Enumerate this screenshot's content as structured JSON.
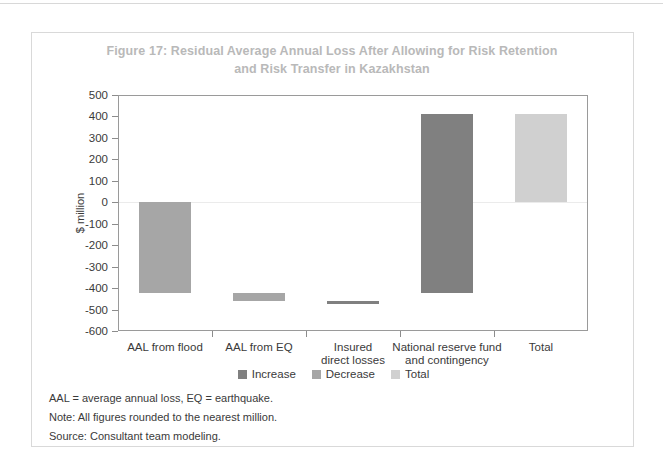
{
  "figure": {
    "title_line1": "Figure 17: Residual Average Annual Loss After Allowing for Risk Retention",
    "title_line2": "and Risk Transfer in Kazakhstan",
    "title_color": "#b9b9b9"
  },
  "notes": [
    "AAL = average annual loss, EQ = earthquake.",
    "Note: All figures rounded to the nearest million.",
    "Source: Consultant team modeling."
  ],
  "colors": {
    "increase": "#808080",
    "decrease": "#a6a6a6",
    "total": "#d0d0d0",
    "axis": "#9a9a9a",
    "text": "#3a3a3a",
    "zero_line": "#ebebeb"
  },
  "chart_data": {
    "type": "bar",
    "title": "Figure 17: Residual Average Annual Loss After Allowing for Risk Retention and Risk Transfer in Kazakhstan",
    "subtitle": "",
    "xlabel": "",
    "ylabel": "$ million",
    "ylim": [
      -600,
      500
    ],
    "ytick_values": [
      500,
      400,
      300,
      200,
      100,
      0,
      -100,
      -200,
      -300,
      -400,
      -500,
      -600
    ],
    "ytick_labels": [
      "500",
      "400",
      "300",
      "200",
      "100",
      "0",
      "-100",
      "-200",
      "-300",
      "-400",
      "-500",
      "-600"
    ],
    "grid": false,
    "legend_position": "bottom",
    "legend": [
      {
        "name": "Increase",
        "color": "#808080"
      },
      {
        "name": "Decrease",
        "color": "#a6a6a6"
      },
      {
        "name": "Total",
        "color": "#d0d0d0"
      }
    ],
    "categories": [
      "AAL from flood",
      "AAL from EQ",
      "Insured\ndirect losses",
      "National reserve fund\nand contingency",
      "Total"
    ],
    "category_labels": [
      {
        "line1": "AAL from flood",
        "line2": ""
      },
      {
        "line1": "AAL from EQ",
        "line2": ""
      },
      {
        "line1": "Insured",
        "line2": "direct losses"
      },
      {
        "line1": "National reserve fund",
        "line2": "and contingency"
      },
      {
        "line1": "Total",
        "line2": ""
      }
    ],
    "waterfall": true,
    "bars": [
      {
        "category": "AAL from flood",
        "start": 0,
        "end": -425,
        "delta": -425,
        "series": "Decrease",
        "color": "#a6a6a6"
      },
      {
        "category": "AAL from EQ",
        "start": -425,
        "end": -460,
        "delta": -35,
        "series": "Decrease",
        "color": "#a6a6a6"
      },
      {
        "category": "Insured direct losses",
        "start": -460,
        "end": -475,
        "delta": 15,
        "series": "Increase",
        "color": "#808080"
      },
      {
        "category": "National reserve fund and contingency",
        "start": -425,
        "end": 410,
        "delta": 835,
        "series": "Increase",
        "color": "#808080"
      },
      {
        "category": "Total",
        "start": 0,
        "end": 410,
        "delta": 410,
        "series": "Total",
        "color": "#d0d0d0"
      }
    ]
  }
}
